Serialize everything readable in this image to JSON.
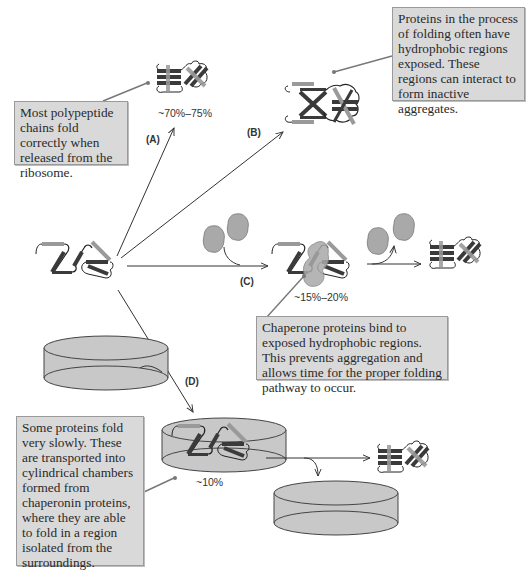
{
  "diagram": {
    "pathways": [
      {
        "id": "A",
        "label": "(A)",
        "percentage": "~70%–75%",
        "outcome": "folded-protein"
      },
      {
        "id": "B",
        "label": "(B)",
        "outcome": "inactive-aggregate"
      },
      {
        "id": "C",
        "label": "(C)",
        "percentage": "~15%–20%",
        "outcome": "chaperone-assisted-folding"
      },
      {
        "id": "D",
        "label": "(D)",
        "percentage": "~10%",
        "outcome": "chaperonin-chamber-folding"
      }
    ],
    "notes": {
      "a": "Most polypeptide chains fold correctly when released from the ribosome.",
      "b": "Proteins in the process of folding often have hydrophobic regions exposed. These regions can interact to form inactive aggregates.",
      "c": "Chaperone proteins bind to exposed hydrophobic regions. This prevents aggregation and allows time for the proper folding pathway to occur.",
      "d": "Some proteins fold very slowly. These are transported into cylindrical chambers formed from chaperonin proteins, where they are able to fold in a region isolated from the surroundings."
    },
    "colors": {
      "note_bg": "#d9d9d9",
      "chaperone_fill": "#a9a9a9",
      "chamber_fill": "#c8c8c8",
      "strand_dark": "#3a3a3a",
      "strand_light": "#9a9a9a",
      "arrow": "#333333"
    }
  }
}
